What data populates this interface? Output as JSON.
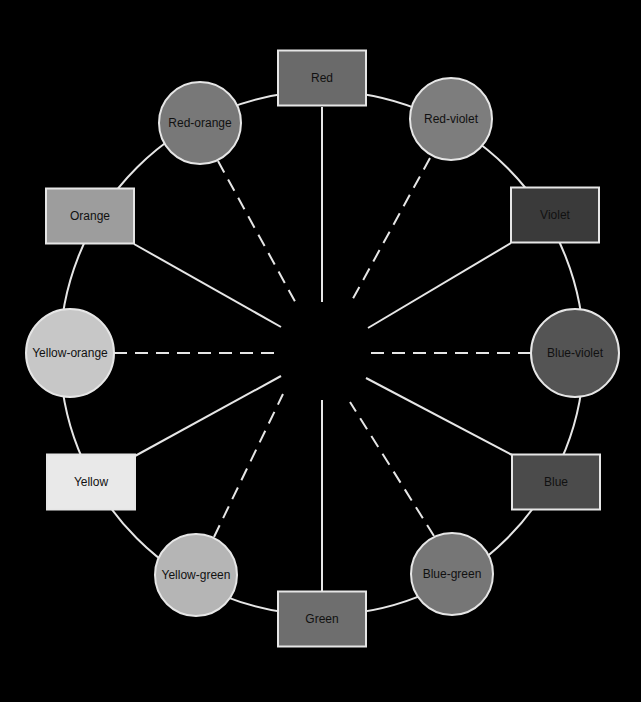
{
  "diagram": {
    "background": "#000000",
    "line_color": "#e6e6e6",
    "center": {
      "x": 322,
      "y": 353
    },
    "ring_radius": 262,
    "nodes": [
      {
        "label": "Red",
        "shape": "rect",
        "type": "primary/secondary",
        "fill": "#6a6a6a",
        "cx": 322,
        "cy": 78,
        "w": 88,
        "h": 55
      },
      {
        "label": "Red-violet",
        "shape": "circle",
        "type": "tertiary",
        "fill": "#7d7d7d",
        "cx": 451,
        "cy": 119,
        "r": 41
      },
      {
        "label": "Violet",
        "shape": "rect",
        "type": "primary/secondary",
        "fill": "#3a3a3a",
        "cx": 555,
        "cy": 215,
        "w": 88,
        "h": 55
      },
      {
        "label": "Blue-violet",
        "shape": "circle",
        "type": "tertiary",
        "fill": "#545454",
        "cx": 575,
        "cy": 353,
        "r": 44
      },
      {
        "label": "Blue",
        "shape": "rect",
        "type": "primary/secondary",
        "fill": "#4b4b4b",
        "cx": 556,
        "cy": 482,
        "w": 88,
        "h": 55
      },
      {
        "label": "Blue-green",
        "shape": "circle",
        "type": "tertiary",
        "fill": "#767676",
        "cx": 452,
        "cy": 574,
        "r": 41
      },
      {
        "label": "Green",
        "shape": "rect",
        "type": "primary/secondary",
        "fill": "#6e6e6e",
        "cx": 322,
        "cy": 619,
        "w": 88,
        "h": 55
      },
      {
        "label": "Yellow-green",
        "shape": "circle",
        "type": "tertiary",
        "fill": "#b5b5b5",
        "cx": 196,
        "cy": 575,
        "r": 41
      },
      {
        "label": "Yellow",
        "shape": "rect",
        "type": "primary/secondary",
        "fill": "#e9e9e9",
        "cx": 91,
        "cy": 482,
        "w": 88,
        "h": 55
      },
      {
        "label": "Yellow-orange",
        "shape": "circle",
        "type": "tertiary",
        "fill": "#c7c7c7",
        "cx": 70,
        "cy": 353,
        "r": 44
      },
      {
        "label": "Orange",
        "shape": "rect",
        "type": "primary/secondary",
        "fill": "#9d9d9d",
        "cx": 90,
        "cy": 216,
        "w": 88,
        "h": 55
      },
      {
        "label": "Red-orange",
        "shape": "circle",
        "type": "tertiary",
        "fill": "#787878",
        "cx": 200,
        "cy": 123,
        "r": 41
      }
    ],
    "spokes": [
      {
        "to": "Red",
        "style": "solid",
        "x1": 322,
        "y1": 107,
        "x2": 322,
        "y2": 302
      },
      {
        "to": "Red-violet",
        "style": "dashed",
        "x1": 430,
        "y1": 158,
        "x2": 350,
        "y2": 304
      },
      {
        "to": "Violet",
        "style": "solid",
        "x1": 511,
        "y1": 243,
        "x2": 368,
        "y2": 328
      },
      {
        "to": "Blue-violet",
        "style": "dashed",
        "x1": 531,
        "y1": 353,
        "x2": 370,
        "y2": 353
      },
      {
        "to": "Blue",
        "style": "solid",
        "x1": 512,
        "y1": 455,
        "x2": 366,
        "y2": 378
      },
      {
        "to": "Blue-green",
        "style": "dashed",
        "x1": 434,
        "y1": 536,
        "x2": 350,
        "y2": 402
      },
      {
        "to": "Green",
        "style": "solid",
        "x1": 322,
        "y1": 591,
        "x2": 322,
        "y2": 400
      },
      {
        "to": "Yellow-green",
        "style": "dashed",
        "x1": 214,
        "y1": 537,
        "x2": 283,
        "y2": 394
      },
      {
        "to": "Yellow",
        "style": "solid",
        "x1": 135,
        "y1": 456,
        "x2": 281,
        "y2": 376
      },
      {
        "to": "Yellow-orange",
        "style": "dashed",
        "x1": 114,
        "y1": 353,
        "x2": 278,
        "y2": 353
      },
      {
        "to": "Orange",
        "style": "solid",
        "x1": 134,
        "y1": 244,
        "x2": 281,
        "y2": 327
      },
      {
        "to": "Red-orange",
        "style": "dashed",
        "x1": 218,
        "y1": 161,
        "x2": 298,
        "y2": 307
      }
    ]
  }
}
